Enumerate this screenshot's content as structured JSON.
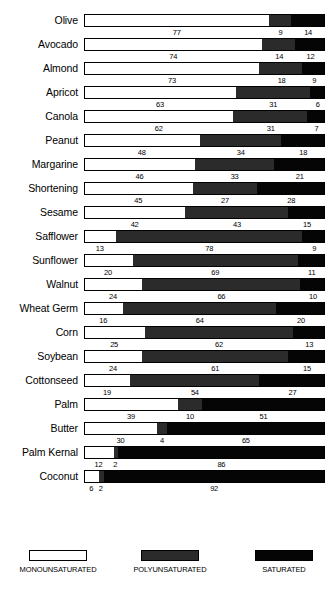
{
  "chart_data": {
    "type": "bar",
    "subtype": "stacked-horizontal-100pct",
    "title": "",
    "xlabel": "",
    "ylabel": "",
    "xlim": [
      0,
      100
    ],
    "grid": false,
    "legend_position": "bottom",
    "categories": [
      "Olive",
      "Avocado",
      "Almond",
      "Apricot",
      "Canola",
      "Peanut",
      "Margarine",
      "Shortening",
      "Sesame",
      "Safflower",
      "Sunflower",
      "Walnut",
      "Wheat Germ",
      "Corn",
      "Soybean",
      "Cottonseed",
      "Palm",
      "Butter",
      "Palm Kernal",
      "Coconut"
    ],
    "series": [
      {
        "name": "MONOUNSATURATED",
        "color": "#ffffff",
        "values": [
          77,
          74,
          73,
          63,
          62,
          48,
          46,
          45,
          42,
          13,
          20,
          24,
          16,
          25,
          24,
          19,
          39,
          30,
          12,
          6
        ]
      },
      {
        "name": "POLYUNSATURATED",
        "color": "#2b2b2b",
        "values": [
          9,
          14,
          18,
          31,
          31,
          34,
          33,
          27,
          43,
          78,
          69,
          66,
          64,
          62,
          61,
          54,
          10,
          4,
          2,
          2
        ]
      },
      {
        "name": "SATURATED",
        "color": "#050505",
        "values": [
          14,
          12,
          9,
          6,
          7,
          18,
          21,
          28,
          15,
          9,
          11,
          10,
          20,
          13,
          15,
          27,
          51,
          65,
          86,
          92
        ]
      }
    ]
  },
  "legend": {
    "items": [
      {
        "label": "MONOUNSATURATED",
        "swatch": "mono"
      },
      {
        "label": "POLYUNSATURATED",
        "swatch": "poly"
      },
      {
        "label": "SATURATED",
        "swatch": "sat"
      }
    ]
  }
}
